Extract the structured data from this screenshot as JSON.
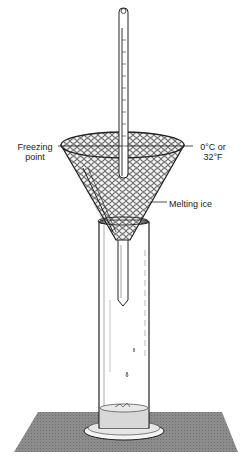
{
  "diagram": {
    "type": "labeled-illustration",
    "labels": {
      "freezing_point_line1": "Freezing",
      "freezing_point_line2": "point",
      "temperature_line1": "0°C or",
      "temperature_line2": "32°F",
      "melting_ice": "Melting ice"
    },
    "components": [
      "thermometer",
      "funnel",
      "melting-ice",
      "graduated-cylinder",
      "water-drops",
      "collected-water",
      "base-plate"
    ],
    "colors": {
      "ink": "#222222",
      "base_plate": "#8a8a8a",
      "water": "#d8d8d8",
      "background": "#ffffff"
    }
  }
}
